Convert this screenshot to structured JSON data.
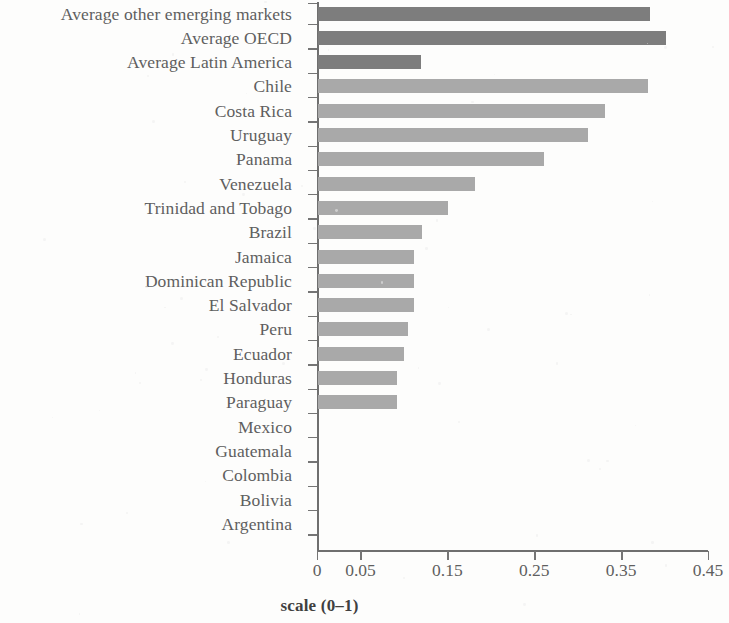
{
  "chart_data": {
    "type": "bar",
    "orientation": "horizontal",
    "title": "",
    "subtitle": "",
    "xlabel": "scale (0–1)",
    "ylabel": "",
    "xlim": [
      0,
      0.45
    ],
    "ylim": null,
    "grid": false,
    "legend": null,
    "legend_position": "none",
    "xticks": [
      "0",
      "0.05",
      "0.15",
      "0.25",
      "0.35",
      "0.45"
    ],
    "xtick_values": [
      0,
      0.05,
      0.15,
      0.25,
      0.35,
      0.45
    ],
    "categories": [
      "Average other emerging markets",
      "Average OECD",
      "Average Latin America",
      "Chile",
      "Costa Rica",
      "Uruguay",
      "Panama",
      "Venezuela",
      "Trinidad and Tobago",
      "Brazil",
      "Jamaica",
      "Dominican Republic",
      "El Salvador",
      "Peru",
      "Ecuador",
      "Honduras",
      "Paraguay",
      "Mexico",
      "Guatemala",
      "Colombia",
      "Bolivia",
      "Argentina"
    ],
    "values": [
      0.382,
      0.4,
      0.119,
      0.38,
      0.33,
      0.311,
      0.26,
      0.181,
      0.15,
      0.12,
      0.11,
      0.11,
      0.11,
      0.104,
      0.099,
      0.091,
      0.091,
      0.0,
      0.0,
      0.0,
      0.0,
      0.0
    ],
    "group": [
      "average",
      "average",
      "average",
      "country",
      "country",
      "country",
      "country",
      "country",
      "country",
      "country",
      "country",
      "country",
      "country",
      "country",
      "country",
      "country",
      "country",
      "country",
      "country",
      "country",
      "country",
      "country"
    ],
    "colors": {
      "average_bar": "#7d7d7d",
      "country_bar": "#a9a9a9",
      "axis": "#6f6f6f",
      "text": "#5f5f5f",
      "background": "#fdfdfc"
    }
  }
}
